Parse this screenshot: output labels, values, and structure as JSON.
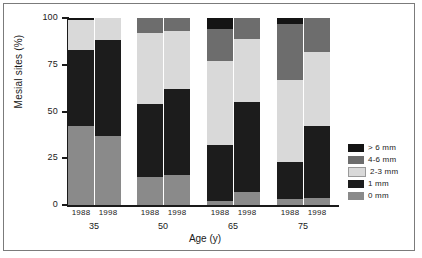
{
  "chart_data": {
    "type": "bar",
    "subtype": "stacked-bar-100",
    "title": "",
    "xlabel": "Age (y)",
    "ylabel": "Mesial sites (%)",
    "ylim": [
      0,
      100
    ],
    "yticks": [
      0,
      25,
      50,
      75,
      100
    ],
    "ytick_labels": [
      "0",
      "25",
      "50",
      "75",
      "100"
    ],
    "grid": false,
    "legend_position": "right",
    "age_groups": [
      "35",
      "50",
      "65",
      "75"
    ],
    "years": [
      "1988",
      "1998"
    ],
    "categories": [
      "35 1988",
      "35 1998",
      "50 1988",
      "50 1998",
      "65 1988",
      "65 1998",
      "75 1988",
      "75 1998"
    ],
    "series": [
      {
        "name": "0 mm",
        "color": "#8a8a8a",
        "values": [
          42,
          37,
          15,
          16,
          2,
          7,
          3,
          4
        ]
      },
      {
        "name": "1 mm",
        "color": "#1c1c1c",
        "values": [
          41,
          51,
          39,
          46,
          30,
          48,
          20,
          38
        ]
      },
      {
        "name": "2-3 mm",
        "color": "#d9d9d9",
        "values": [
          16,
          12,
          38,
          31,
          45,
          34,
          44,
          40
        ]
      },
      {
        "name": "4-6 mm",
        "color": "#6d6d6d",
        "values": [
          0,
          0,
          8,
          7,
          17,
          11,
          30,
          18
        ]
      },
      {
        "name": "> 6 mm",
        "color": "#141414",
        "values": [
          1,
          0,
          0,
          0,
          6,
          0,
          3,
          0
        ]
      }
    ],
    "legend_entries": [
      {
        "label": "> 6 mm",
        "color": "#141414"
      },
      {
        "label": "4-6 mm",
        "color": "#6d6d6d"
      },
      {
        "label": "2-3 mm",
        "color": "#d9d9d9"
      },
      {
        "label": "1 mm",
        "color": "#1c1c1c"
      },
      {
        "label": "0 mm",
        "color": "#8a8a8a"
      }
    ]
  },
  "axis": {
    "y_label": "Mesial sites (%)",
    "x_label": "Age (y)",
    "y_ticks": [
      "100",
      "75",
      "50",
      "25",
      "0"
    ]
  },
  "groups": [
    {
      "age": "35",
      "bars": [
        {
          "year": "1988"
        },
        {
          "year": "1998"
        }
      ]
    },
    {
      "age": "50",
      "bars": [
        {
          "year": "1988"
        },
        {
          "year": "1998"
        }
      ]
    },
    {
      "age": "65",
      "bars": [
        {
          "year": "1988"
        },
        {
          "year": "1998"
        }
      ]
    },
    {
      "age": "75",
      "bars": [
        {
          "year": "1988"
        },
        {
          "year": "1998"
        }
      ]
    }
  ],
  "legend": {
    "items": [
      {
        "label": "> 6 mm"
      },
      {
        "label": "4-6 mm"
      },
      {
        "label": "2-3 mm"
      },
      {
        "label": "1 mm"
      },
      {
        "label": "0 mm"
      }
    ]
  }
}
